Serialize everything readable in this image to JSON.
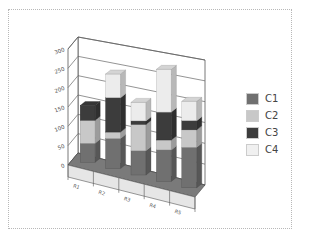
{
  "chart_data": {
    "type": "bar",
    "subtype": "stacked-3d",
    "title": "",
    "xlabel": "",
    "ylabel": "",
    "categories": [
      "R1",
      "R2",
      "R3",
      "R4",
      "R5"
    ],
    "series": [
      {
        "name": "C1",
        "color": "#707070",
        "values": [
          45,
          70,
          55,
          70,
          88
        ]
      },
      {
        "name": "C2",
        "color": "#c8c8c8",
        "values": [
          55,
          15,
          60,
          22,
          38
        ]
      },
      {
        "name": "C3",
        "color": "#3c3c3c",
        "values": [
          35,
          80,
          8,
          62,
          20
        ]
      },
      {
        "name": "C4",
        "color": "#ececec",
        "values": [
          0,
          55,
          42,
          95,
          42
        ]
      }
    ],
    "ylim": [
      0,
      300
    ],
    "yticks": [
      "0",
      "50",
      "100",
      "150",
      "200",
      "250",
      "300"
    ],
    "grid": true,
    "legend_position": "right"
  },
  "legend": {
    "items": [
      {
        "label": "C1",
        "color": "#707070"
      },
      {
        "label": "C2",
        "color": "#c8c8c8"
      },
      {
        "label": "C3",
        "color": "#3c3c3c"
      },
      {
        "label": "C4",
        "color": "#ececec"
      }
    ]
  }
}
